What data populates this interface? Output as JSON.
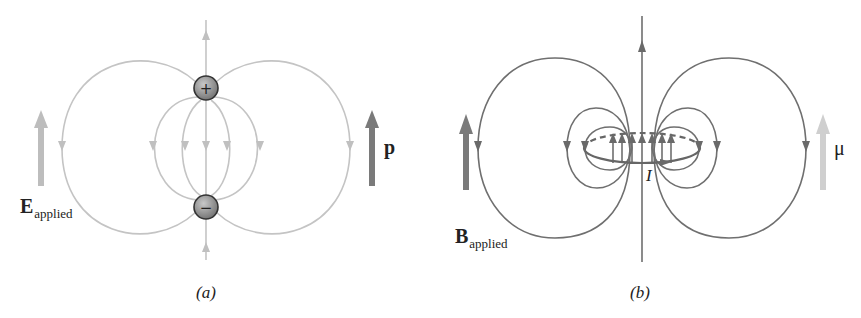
{
  "panels": [
    {
      "id": "a",
      "caption": "(a)",
      "applied_field_label": {
        "symbol": "E",
        "subscript": "applied"
      },
      "moment_label": "p",
      "charges": [
        {
          "sign": "+",
          "symbol": "+"
        },
        {
          "sign": "-",
          "symbol": "−"
        }
      ],
      "colors": {
        "field_lines": "#c4c4c4",
        "applied_arrow": "#bdbdbd",
        "moment_arrow": "#7a7a7a",
        "charge_fill": "#8c8c8c"
      }
    },
    {
      "id": "b",
      "caption": "(b)",
      "applied_field_label": {
        "symbol": "B",
        "subscript": "applied"
      },
      "moment_label": "μ",
      "current_label": "I",
      "colors": {
        "field_lines": "#6f6f6f",
        "applied_arrow": "#7a7a7a",
        "moment_arrow": "#cfcfcf"
      }
    }
  ]
}
